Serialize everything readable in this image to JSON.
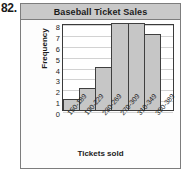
{
  "problem": {
    "number": "82."
  },
  "chart_data": {
    "type": "bar",
    "title": "Baseball Ticket Sales",
    "xlabel": "Tickets sold",
    "ylabel": "Frequency",
    "categories": [
      "150-189",
      "190-229",
      "230-269",
      "270-309",
      "310-349",
      "350-389"
    ],
    "values": [
      1,
      2,
      4,
      8,
      8,
      7
    ],
    "ylim": [
      0,
      8
    ],
    "yticks": [
      "0",
      "1",
      "2",
      "3",
      "4",
      "5",
      "6",
      "7",
      "8"
    ],
    "grid": true,
    "legend": false,
    "bar_color": "#c6c6c6",
    "bar_border_color": "#3f3f3f",
    "plot_background": "#ffffff",
    "title_bar_color": "#c9c9c9",
    "frame_color": "#7d7d7d"
  }
}
